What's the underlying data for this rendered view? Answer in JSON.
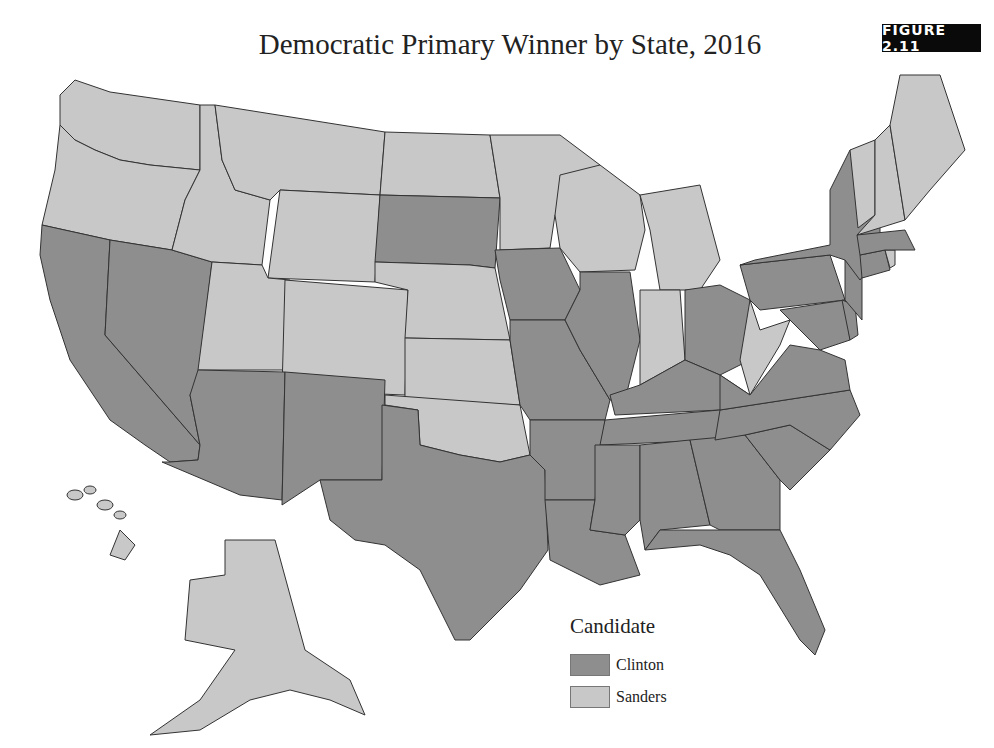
{
  "title": "Democratic Primary Winner by State, 2016",
  "figure_label": "FIGURE 2.11",
  "legend": {
    "title": "Candidate",
    "items": [
      {
        "label": "Clinton",
        "color": "#8e8e8e"
      },
      {
        "label": "Sanders",
        "color": "#c8c8c8"
      }
    ]
  },
  "colors": {
    "Clinton": "#8e8e8e",
    "Sanders": "#c8c8c8",
    "border": "#333333"
  },
  "chart_data": {
    "type": "choropleth",
    "title": "Democratic Primary Winner by State, 2016",
    "legend_title": "Candidate",
    "categories": [
      "Clinton",
      "Sanders"
    ],
    "winners": {
      "Clinton": [
        "CA",
        "NV",
        "AZ",
        "NM",
        "TX",
        "SD",
        "IA",
        "MO",
        "AR",
        "LA",
        "IL",
        "MS",
        "AL",
        "TN",
        "KY",
        "OH",
        "GA",
        "FL",
        "SC",
        "NC",
        "VA",
        "MD",
        "DE",
        "NJ",
        "PA",
        "NY",
        "CT",
        "MA"
      ],
      "Sanders": [
        "WA",
        "OR",
        "ID",
        "MT",
        "WY",
        "UT",
        "CO",
        "ND",
        "NE",
        "KS",
        "OK",
        "MN",
        "WI",
        "MI",
        "IN",
        "WV",
        "VT",
        "NH",
        "ME",
        "RI",
        "AK",
        "HI"
      ]
    }
  }
}
